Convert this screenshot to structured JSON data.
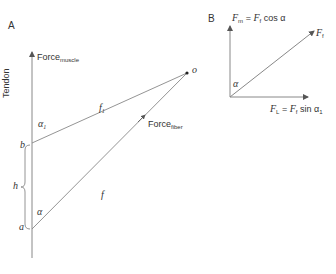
{
  "panel_a": {
    "label": "A",
    "tendon_label": "Tendon",
    "force_muscle": {
      "main": "Force",
      "sub": "muscle"
    },
    "force_fiber": {
      "main": "Force",
      "sub": "fiber"
    },
    "point_b": "b",
    "point_a": "a",
    "point_o": "o",
    "h_label": "h",
    "f1": {
      "main": "f",
      "sub": "1"
    },
    "f": "f",
    "alpha1": {
      "main": "α",
      "sub": "1"
    },
    "alpha": "α"
  },
  "panel_b": {
    "label": "B",
    "fm_eq": {
      "lhs": "F",
      "lhs_sub": "m",
      "eq": "=",
      "rhs": "F",
      "rhs_sub": "f",
      "fn": "cos α"
    },
    "ft_label": {
      "main": "F",
      "sub": "f"
    },
    "fl_eq": {
      "lhs": "F",
      "lhs_sub": "L",
      "eq": "=",
      "rhs": "F",
      "rhs_sub": "f",
      "fn": "sin α",
      "fn_sub": "1"
    },
    "alpha": "α"
  },
  "colors": {
    "line": "#777777",
    "text": "#333333"
  }
}
